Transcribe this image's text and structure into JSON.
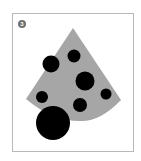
{
  "figure": {
    "badge": {
      "number": "3",
      "fill": "#707070"
    },
    "frame_color": "#b8b8b8",
    "wedge": {
      "fill": "#a6a6a6",
      "apex": [
        73,
        28
      ],
      "left": [
        26,
        99
      ],
      "right": [
        121,
        100
      ],
      "arc_bottom": [
        80,
        121
      ]
    },
    "circles": [
      {
        "cx": 51,
        "cy": 64,
        "r": 8.5
      },
      {
        "cx": 74,
        "cy": 56,
        "r": 6.5
      },
      {
        "cx": 85,
        "cy": 81,
        "r": 9.5
      },
      {
        "cx": 42,
        "cy": 97,
        "r": 6
      },
      {
        "cx": 106,
        "cy": 94,
        "r": 5.5
      },
      {
        "cx": 80,
        "cy": 105,
        "r": 7
      },
      {
        "cx": 53,
        "cy": 123,
        "r": 17
      }
    ],
    "circle_fill": "#000000"
  }
}
